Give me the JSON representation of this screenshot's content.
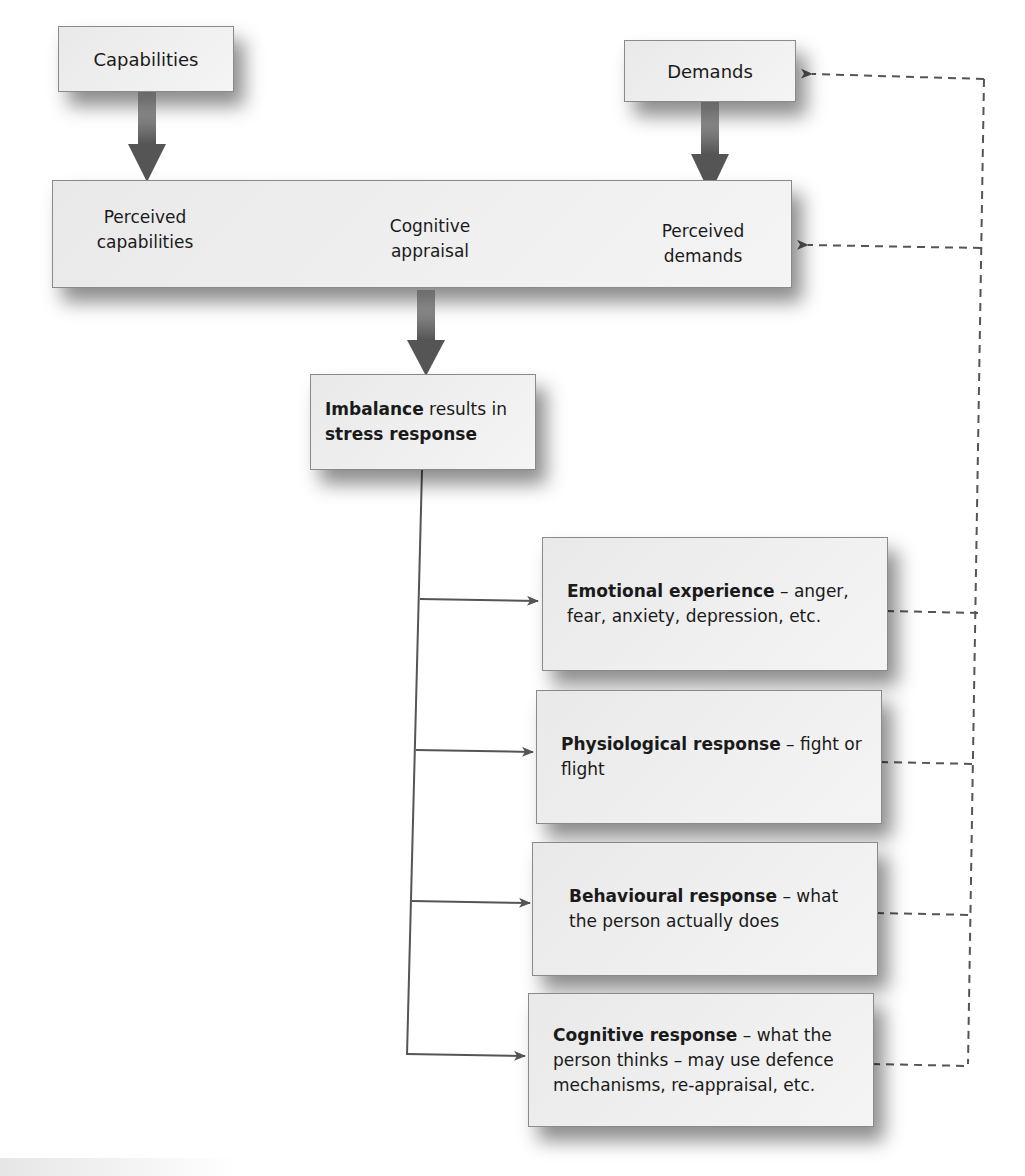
{
  "diagram": {
    "type": "flowchart",
    "title": "",
    "nodes": {
      "capabilities": {
        "label": "Capabilities"
      },
      "demands": {
        "label": "Demands"
      },
      "appraisal_band": {
        "perceived_capabilities": "Perceived capabilities",
        "perceived_capabilities_line1": "Perceived",
        "perceived_capabilities_line2": "capabilities",
        "cognitive_appraisal_line1": "Cognitive",
        "cognitive_appraisal_line2": "appraisal",
        "perceived_demands_line1": "Perceived",
        "perceived_demands_line2": "demands"
      },
      "imbalance": {
        "bold_1": "Imbalance",
        "regular_1": " results in",
        "bold_2": "stress response"
      },
      "responses": [
        {
          "bold": "Emotional experience",
          "regular": " – anger, fear, anxiety, depression, etc."
        },
        {
          "bold": "Physiological response",
          "regular": " – fight or flight"
        },
        {
          "bold": "Behavioural response",
          "regular": " – what the person actually does"
        },
        {
          "bold": "Cognitive response",
          "regular": " – what the person thinks – may use defence mechanisms, re-appraisal, etc."
        }
      ]
    },
    "edges": [
      {
        "from": "Capabilities",
        "to": "Perceived capabilities",
        "style": "thick-arrow"
      },
      {
        "from": "Demands",
        "to": "Perceived demands",
        "style": "thick-arrow"
      },
      {
        "from": "Perceived capabilities",
        "to": "Cognitive appraisal",
        "style": "gradient-arrow"
      },
      {
        "from": "Perceived demands",
        "to": "Cognitive appraisal",
        "style": "gradient-arrow"
      },
      {
        "from": "Cognitive appraisal",
        "to": "Imbalance results in stress response",
        "style": "thick-arrow"
      },
      {
        "from": "Imbalance results in stress response",
        "to": "Emotional experience",
        "style": "thin-arrow"
      },
      {
        "from": "Imbalance results in stress response",
        "to": "Physiological response",
        "style": "thin-arrow"
      },
      {
        "from": "Imbalance results in stress response",
        "to": "Behavioural response",
        "style": "thin-arrow"
      },
      {
        "from": "Imbalance results in stress response",
        "to": "Cognitive response",
        "style": "thin-arrow"
      },
      {
        "from": "Responses",
        "to": "Demands",
        "style": "dashed-feedback"
      },
      {
        "from": "Responses",
        "to": "Perceived demands",
        "style": "dashed-feedback"
      }
    ],
    "colors": {
      "box_fill": "#ececec",
      "box_border": "#8a8a8a",
      "arrow_dark": "#555555",
      "dashed_line": "#555555",
      "text": "#1a1a1a"
    }
  }
}
